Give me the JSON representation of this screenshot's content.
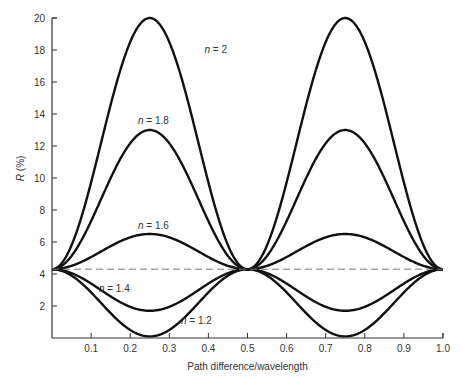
{
  "chart_data": {
    "type": "line",
    "title": "",
    "xlabel": "Path difference/wavelength",
    "ylabel": "R (%)",
    "ylabel_var": "R",
    "ylabel_unit": " (%)",
    "xlim": [
      0,
      1.0
    ],
    "ylim": [
      0,
      20
    ],
    "grid": false,
    "legend": "inline curve labels",
    "x_ticks": [
      0.1,
      0.2,
      0.3,
      0.4,
      0.5,
      0.6,
      0.7,
      0.8,
      0.9,
      1.0
    ],
    "x_tick_labels": [
      "0.1",
      "0.2",
      "0.3",
      "0.4",
      "0.5",
      "0.6",
      "0.7",
      "0.8",
      "0.9",
      "1.0"
    ],
    "y_ticks": [
      2,
      4,
      6,
      8,
      10,
      12,
      14,
      16,
      18,
      20
    ],
    "y_tick_labels": [
      "2",
      "4",
      "6",
      "8",
      "10",
      "12",
      "14",
      "16",
      "18",
      "20"
    ],
    "reference_line": {
      "style": "dashed",
      "value": 4.3,
      "label": "uncoated substrate reflectance"
    },
    "series": [
      {
        "name": "n = 2",
        "label_var": "n",
        "label_val": " = 2",
        "at_0": 4.3,
        "peak_at_0.25": 20.0,
        "at_0.5": 4.3,
        "peak_at_0.75": 20.0,
        "at_1.0": 4.3
      },
      {
        "name": "n = 1.8",
        "label_var": "n",
        "label_val": " = 1.8",
        "at_0": 4.3,
        "peak_at_0.25": 13.0,
        "at_0.5": 4.3,
        "peak_at_0.75": 13.0,
        "at_1.0": 4.3
      },
      {
        "name": "n = 1.6",
        "label_var": "n",
        "label_val": " = 1.6",
        "at_0": 4.3,
        "peak_at_0.25": 6.5,
        "at_0.5": 4.3,
        "peak_at_0.75": 6.5,
        "at_1.0": 4.3
      },
      {
        "name": "n = 1.4",
        "label_var": "n",
        "label_val": " = 1.4",
        "at_0": 4.3,
        "peak_at_0.25": 1.7,
        "at_0.5": 4.3,
        "peak_at_0.75": 1.7,
        "at_1.0": 4.3
      },
      {
        "name": "n = 1.2",
        "label_var": "n",
        "label_val": " = 1.2",
        "at_0": 4.3,
        "peak_at_0.25": 0.1,
        "at_0.5": 4.3,
        "peak_at_0.75": 0.1,
        "at_1.0": 4.3
      }
    ],
    "label_positions": [
      {
        "series": "n = 2",
        "x": 0.39,
        "y": 17.8
      },
      {
        "series": "n = 1.8",
        "x": 0.22,
        "y": 13.4
      },
      {
        "series": "n = 1.6",
        "x": 0.22,
        "y": 6.8
      },
      {
        "series": "n = 1.4",
        "x": 0.12,
        "y": 2.9
      },
      {
        "series": "n = 1.2",
        "x": 0.33,
        "y": 0.9
      }
    ],
    "colors": {
      "curve": "#111111",
      "axis": "#333333",
      "dashed": "#777777",
      "text": "#333333"
    }
  }
}
